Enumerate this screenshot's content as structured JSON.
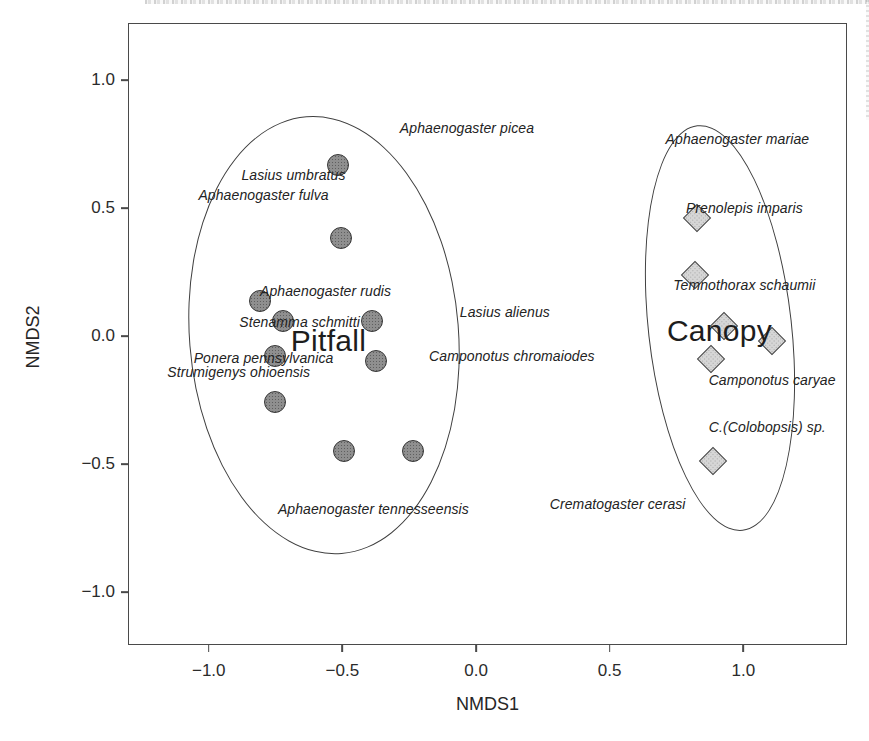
{
  "figure": {
    "background": "#ffffff",
    "box_border_color": "#4a4a4a",
    "text_color": "#232323"
  },
  "chart_data": {
    "type": "scatter",
    "title": "",
    "xlabel": "NMDS1",
    "ylabel": "NMDS2",
    "axes": {
      "x": {
        "min": -1.2985,
        "max": 1.3843
      },
      "y": {
        "min": -1.2027,
        "max": 1.2184
      }
    },
    "grid": false,
    "legend": "none",
    "x_ticks": [
      {
        "value": -1.0,
        "label": "−1.0"
      },
      {
        "value": -0.5,
        "label": "−0.5"
      },
      {
        "value": 0.0,
        "label": "0.0"
      },
      {
        "value": 0.5,
        "label": "0.5"
      },
      {
        "value": 1.0,
        "label": "1.0"
      }
    ],
    "y_ticks": [
      {
        "value": 1.0,
        "label": "1.0"
      },
      {
        "value": 0.5,
        "label": "0.5"
      },
      {
        "value": 0.0,
        "label": "0.0"
      },
      {
        "value": -0.5,
        "label": "−0.5"
      },
      {
        "value": -1.0,
        "label": "−1.0"
      }
    ],
    "series": [
      {
        "name": "Pitfall",
        "marker": "circle",
        "fill": "#8f8f8f",
        "stroke": "#383838",
        "points": [
          {
            "x": -0.515,
            "y": 0.669
          },
          {
            "x": -0.507,
            "y": 0.384
          },
          {
            "x": -0.81,
            "y": 0.138
          },
          {
            "x": -0.724,
            "y": 0.06
          },
          {
            "x": -0.388,
            "y": 0.057
          },
          {
            "x": -0.754,
            "y": -0.08
          },
          {
            "x": -0.373,
            "y": -0.099
          },
          {
            "x": -0.754,
            "y": -0.259
          },
          {
            "x": -0.493,
            "y": -0.45
          },
          {
            "x": -0.235,
            "y": -0.45
          }
        ]
      },
      {
        "name": "Canopy",
        "marker": "diamond",
        "fill": "#d6d6d6",
        "stroke": "#474747",
        "points": [
          {
            "x": 0.828,
            "y": 0.462
          },
          {
            "x": 0.821,
            "y": 0.24
          },
          {
            "x": 0.929,
            "y": 0.041
          },
          {
            "x": 1.108,
            "y": -0.018
          },
          {
            "x": 0.881,
            "y": -0.088
          },
          {
            "x": 0.888,
            "y": -0.489
          }
        ]
      }
    ],
    "group_labels": [
      {
        "text": "Pitfall",
        "x": -0.552,
        "y": -0.018
      },
      {
        "text": "Canopy",
        "x": 0.911,
        "y": 0.018
      }
    ],
    "species_labels": [
      {
        "text": "Aphaenogaster picea",
        "x": -0.034,
        "y": 0.813
      },
      {
        "text": "Lasius umbratus",
        "x": -0.683,
        "y": 0.63
      },
      {
        "text": "Aphaenogaster fulva",
        "x": -0.795,
        "y": 0.552
      },
      {
        "text": "Aphaenogaster rudis",
        "x": -0.563,
        "y": 0.177
      },
      {
        "text": "Stenamma schmitti",
        "x": -0.66,
        "y": 0.053
      },
      {
        "text": "Ponera pennsylvanica",
        "x": -0.795,
        "y": -0.084
      },
      {
        "text": "Strumigenys ohioensis",
        "x": -0.888,
        "y": -0.142
      },
      {
        "text": "Lasius alienus",
        "x": 0.108,
        "y": 0.092
      },
      {
        "text": "Camponotus chromaiodes",
        "x": 0.134,
        "y": -0.08
      },
      {
        "text": "Aphaenogaster tennesseensis",
        "x": -0.384,
        "y": -0.677
      },
      {
        "text": "Crematogaster cerasi",
        "x": 0.53,
        "y": -0.657
      },
      {
        "text": "Aphaenogaster mariae",
        "x": 0.978,
        "y": 0.77
      },
      {
        "text": "Prenolepis imparis",
        "x": 1.004,
        "y": 0.501
      },
      {
        "text": "Temnothorax schaumii",
        "x": 1.004,
        "y": 0.201
      },
      {
        "text": "Camponotus caryae",
        "x": 1.108,
        "y": -0.173
      },
      {
        "text": "C.(Colobopsis) sp.",
        "x": 1.09,
        "y": -0.357
      }
    ],
    "ellipses": [
      {
        "group": "Pitfall",
        "cx": -0.57,
        "cy": 0.002,
        "rx": 0.5,
        "ry": 0.85,
        "rotate_deg": -4.6
      },
      {
        "group": "Canopy",
        "cx": 0.914,
        "cy": 0.033,
        "rx": 0.265,
        "ry": 0.79,
        "rotate_deg": -6.4
      }
    ]
  }
}
